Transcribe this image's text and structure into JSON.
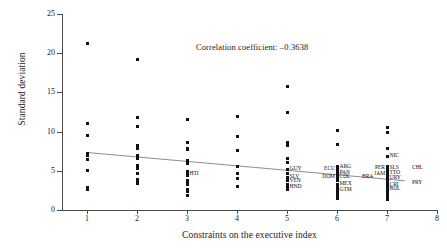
{
  "chart_data": {
    "type": "scatter",
    "title": "",
    "xlabel": "Constraints on the executive index",
    "ylabel": "Standard deviation",
    "xlim": [
      0.5,
      8
    ],
    "ylim": [
      0,
      25
    ],
    "xticks": [
      1,
      2,
      3,
      4,
      5,
      6,
      7,
      8
    ],
    "yticks": [
      0,
      5,
      10,
      15,
      20,
      25
    ],
    "grid": false,
    "legend": null,
    "annotations": [
      {
        "text": "Correlation coefficient: –0.3638",
        "x": 4.35,
        "y": 22.0
      }
    ],
    "correlation_coefficient": -0.3638,
    "trend_line": {
      "x0": 1.0,
      "y0": 7.45,
      "x1": 7.35,
      "y1": 3.85
    },
    "points": [
      {
        "x": 1,
        "y": 21.3
      },
      {
        "x": 1,
        "y": 11.0
      },
      {
        "x": 1,
        "y": 9.5
      },
      {
        "x": 1,
        "y": 7.2
      },
      {
        "x": 1,
        "y": 6.9
      },
      {
        "x": 1,
        "y": 6.5
      },
      {
        "x": 1,
        "y": 5.1
      },
      {
        "x": 1,
        "y": 2.9
      },
      {
        "x": 1,
        "y": 2.6
      },
      {
        "x": 2,
        "y": 19.2
      },
      {
        "x": 2,
        "y": 11.8
      },
      {
        "x": 2,
        "y": 10.6
      },
      {
        "x": 2,
        "y": 8.2
      },
      {
        "x": 2,
        "y": 7.9
      },
      {
        "x": 2,
        "y": 6.9
      },
      {
        "x": 2,
        "y": 6.6
      },
      {
        "x": 2,
        "y": 5.7
      },
      {
        "x": 2,
        "y": 5.3
      },
      {
        "x": 2,
        "y": 4.6
      },
      {
        "x": 2,
        "y": 3.9
      },
      {
        "x": 2,
        "y": 3.6
      },
      {
        "x": 2,
        "y": 3.4
      },
      {
        "x": 3,
        "y": 11.6
      },
      {
        "x": 3,
        "y": 8.6
      },
      {
        "x": 3,
        "y": 7.9
      },
      {
        "x": 3,
        "y": 7.7
      },
      {
        "x": 3,
        "y": 6.3
      },
      {
        "x": 3,
        "y": 5.9
      },
      {
        "x": 3,
        "y": 4.9
      },
      {
        "x": 3,
        "y": 4.6
      },
      {
        "x": 3,
        "y": 4.4
      },
      {
        "x": 3,
        "y": 3.8
      },
      {
        "x": 3,
        "y": 3.5
      },
      {
        "x": 3,
        "y": 3.3
      },
      {
        "x": 3,
        "y": 2.6
      },
      {
        "x": 3,
        "y": 2.3
      },
      {
        "x": 3,
        "y": 1.9
      },
      {
        "x": 4,
        "y": 11.9
      },
      {
        "x": 4,
        "y": 9.4
      },
      {
        "x": 4,
        "y": 7.6
      },
      {
        "x": 4,
        "y": 5.6
      },
      {
        "x": 4,
        "y": 4.7
      },
      {
        "x": 4,
        "y": 4.0
      },
      {
        "x": 4,
        "y": 3.0
      },
      {
        "x": 5,
        "y": 15.7
      },
      {
        "x": 5,
        "y": 12.4
      },
      {
        "x": 5,
        "y": 8.6
      },
      {
        "x": 5,
        "y": 8.2
      },
      {
        "x": 5,
        "y": 6.6
      },
      {
        "x": 5,
        "y": 6.0
      },
      {
        "x": 5,
        "y": 5.2
      },
      {
        "x": 5,
        "y": 4.6
      },
      {
        "x": 5,
        "y": 4.2
      },
      {
        "x": 5,
        "y": 3.8
      },
      {
        "x": 5,
        "y": 3.3
      },
      {
        "x": 5,
        "y": 3.0
      },
      {
        "x": 5,
        "y": 2.6
      },
      {
        "x": 6,
        "y": 10.2
      },
      {
        "x": 6,
        "y": 8.4
      },
      {
        "x": 6,
        "y": 5.5
      },
      {
        "x": 6,
        "y": 5.2
      },
      {
        "x": 6,
        "y": 4.8
      },
      {
        "x": 6,
        "y": 4.4
      },
      {
        "x": 6,
        "y": 4.0
      },
      {
        "x": 6,
        "y": 3.7
      },
      {
        "x": 6,
        "y": 3.3
      },
      {
        "x": 6,
        "y": 2.9
      },
      {
        "x": 6,
        "y": 2.5
      },
      {
        "x": 6,
        "y": 2.1
      },
      {
        "x": 6,
        "y": 1.8
      },
      {
        "x": 6,
        "y": 1.5
      },
      {
        "x": 7,
        "y": 10.5
      },
      {
        "x": 7,
        "y": 9.9
      },
      {
        "x": 7,
        "y": 7.8
      },
      {
        "x": 7,
        "y": 6.8
      },
      {
        "x": 7,
        "y": 5.6
      },
      {
        "x": 7,
        "y": 5.3
      },
      {
        "x": 7,
        "y": 5.0
      },
      {
        "x": 7,
        "y": 4.7
      },
      {
        "x": 7,
        "y": 4.4
      },
      {
        "x": 7,
        "y": 4.1
      },
      {
        "x": 7,
        "y": 3.8
      },
      {
        "x": 7,
        "y": 3.5
      },
      {
        "x": 7,
        "y": 3.2
      },
      {
        "x": 7,
        "y": 2.9
      },
      {
        "x": 7,
        "y": 2.6
      },
      {
        "x": 7,
        "y": 2.3
      },
      {
        "x": 7,
        "y": 2.0
      },
      {
        "x": 7,
        "y": 1.7
      },
      {
        "x": 7,
        "y": 1.4
      }
    ],
    "point_labels": [
      {
        "text": "HTI",
        "x": 3,
        "y": 4.55,
        "anchor": "left"
      },
      {
        "text": "GUY",
        "x": 5,
        "y": 5.25,
        "anchor": "left"
      },
      {
        "text": "SLV",
        "x": 5,
        "y": 4.25,
        "anchor": "left"
      },
      {
        "text": "VEN",
        "x": 5,
        "y": 3.65,
        "anchor": "left"
      },
      {
        "text": "HND",
        "x": 5,
        "y": 2.95,
        "anchor": "left"
      },
      {
        "text": "ECU",
        "x": 6,
        "y": 5.25,
        "anchor": "right"
      },
      {
        "text": "DOM",
        "x": 6,
        "y": 4.25,
        "anchor": "right"
      },
      {
        "text": "ARG",
        "x": 6,
        "y": 5.45,
        "anchor": "left"
      },
      {
        "text": "PAN",
        "x": 6,
        "y": 4.75,
        "anchor": "left"
      },
      {
        "text": "COL",
        "x": 6,
        "y": 4.15,
        "anchor": "left"
      },
      {
        "text": "BRA",
        "x": 6.45,
        "y": 4.15,
        "anchor": "left"
      },
      {
        "text": "MEX",
        "x": 6,
        "y": 3.35,
        "anchor": "left"
      },
      {
        "text": "GTM",
        "x": 6,
        "y": 2.55,
        "anchor": "left"
      },
      {
        "text": "NIC",
        "x": 7,
        "y": 6.85,
        "anchor": "left"
      },
      {
        "text": "PER",
        "x": 7,
        "y": 5.35,
        "anchor": "right"
      },
      {
        "text": "JAM",
        "x": 7,
        "y": 4.65,
        "anchor": "right"
      },
      {
        "text": "SLS",
        "x": 7,
        "y": 5.35,
        "anchor": "left"
      },
      {
        "text": "CHL",
        "x": 7.45,
        "y": 5.35,
        "anchor": "left"
      },
      {
        "text": "TTO",
        "x": 7,
        "y": 4.75,
        "anchor": "left"
      },
      {
        "text": "URY",
        "x": 7,
        "y": 4.05,
        "anchor": "left"
      },
      {
        "text": "CRI",
        "x": 7,
        "y": 3.25,
        "anchor": "left"
      },
      {
        "text": "PRY",
        "x": 7.45,
        "y": 3.45,
        "anchor": "left"
      },
      {
        "text": "BOL",
        "x": 7,
        "y": 2.65,
        "anchor": "left"
      }
    ]
  },
  "colors": {
    "point": "#111111",
    "trend_line": "#8d8d8d",
    "axis": "#4a4a4a",
    "text": "#1a1a1a",
    "background": "#ffffff"
  }
}
